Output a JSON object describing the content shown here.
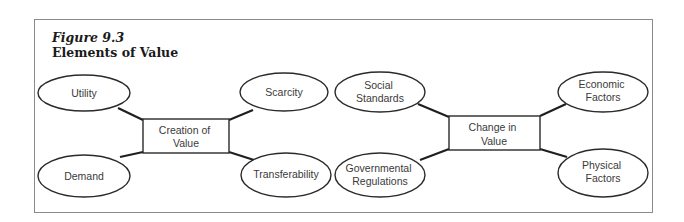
{
  "figure": {
    "number": "Figure 9.3",
    "title": "Elements of Value"
  },
  "diagrams": [
    {
      "center": {
        "lines": [
          "Creation of",
          "Value"
        ]
      },
      "nodes": [
        {
          "id": "utility",
          "lines": [
            "Utility"
          ]
        },
        {
          "id": "scarcity",
          "lines": [
            "Scarcity"
          ]
        },
        {
          "id": "demand",
          "lines": [
            "Demand"
          ]
        },
        {
          "id": "transferability",
          "lines": [
            "Transferability"
          ]
        }
      ]
    },
    {
      "center": {
        "lines": [
          "Change in",
          "Value"
        ]
      },
      "nodes": [
        {
          "id": "social-standards",
          "lines": [
            "Social",
            "Standards"
          ]
        },
        {
          "id": "economic-factors",
          "lines": [
            "Economic",
            "Factors"
          ]
        },
        {
          "id": "governmental-regulations",
          "lines": [
            "Governmental",
            "Regulations"
          ]
        },
        {
          "id": "physical-factors",
          "lines": [
            "Physical",
            "Factors"
          ]
        }
      ]
    }
  ]
}
